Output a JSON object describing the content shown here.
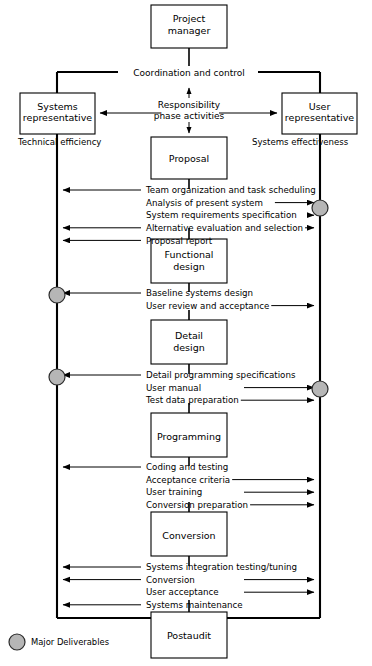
{
  "figure": {
    "colors": {
      "line": "#000000",
      "box_fill": "#ffffff",
      "deliverable_fill": "#b6b6b6",
      "deliverable_stroke": "#2b2b2b",
      "background": "#ffffff"
    }
  },
  "nodes": {
    "project_manager": {
      "line1": "Project",
      "line2": "manager"
    },
    "systems_representative": {
      "line1": "Systems",
      "line2": "representative"
    },
    "user_representative": {
      "line1": "User",
      "line2": "representative"
    },
    "phases": [
      {
        "id": "proposal",
        "line1": "Proposal",
        "line2": ""
      },
      {
        "id": "functional-design",
        "line1": "Functional",
        "line2": "design"
      },
      {
        "id": "detail-design",
        "line1": "Detail",
        "line2": "design"
      },
      {
        "id": "programming",
        "line1": "Programming",
        "line2": ""
      },
      {
        "id": "conversion",
        "line1": "Conversion",
        "line2": ""
      },
      {
        "id": "postaudit",
        "line1": "Postaudit",
        "line2": ""
      }
    ]
  },
  "labels": {
    "coordination": "Coordination and control",
    "responsibility_line1": "Responsibility",
    "responsibility_line2": "phase activities",
    "technical_efficiency": "Technical efficiency",
    "systems_effectiveness": "Systems effectiveness",
    "legend_major_deliverables": "Major Deliverables"
  },
  "activity_groups": [
    {
      "after": "proposal",
      "items": [
        {
          "text": "Team organization and task scheduling",
          "left": true,
          "right": false,
          "leader_left": true,
          "leader_right": false
        },
        {
          "text": "Analysis of present system",
          "left": false,
          "right": true,
          "leader_left": false,
          "leader_right": false
        },
        {
          "text": "System requirements specification",
          "left": false,
          "right": true,
          "leader_left": false,
          "leader_right": false
        },
        {
          "text": "Alternative evaluation and selection",
          "left": true,
          "right": true,
          "leader_left": true,
          "leader_right": true
        },
        {
          "text": "Proposal report",
          "left": true,
          "right": false,
          "leader_left": true,
          "leader_right": false
        }
      ]
    },
    {
      "after": "functional-design",
      "items": [
        {
          "text": "Baseline systems design",
          "left": true,
          "right": false,
          "leader_left": true,
          "leader_right": false
        },
        {
          "text": "User review and acceptance",
          "left": false,
          "right": true,
          "leader_left": false,
          "leader_right": true
        }
      ]
    },
    {
      "after": "detail-design",
      "items": [
        {
          "text": "Detail programming specifications",
          "left": true,
          "right": false,
          "leader_left": true,
          "leader_right": false
        },
        {
          "text": "User manual",
          "left": false,
          "right": true,
          "leader_left": false,
          "leader_right": false
        },
        {
          "text": "Test data preparation",
          "left": false,
          "right": true,
          "leader_left": false,
          "leader_right": true
        }
      ]
    },
    {
      "after": "programming",
      "items": [
        {
          "text": "Coding and testing",
          "left": true,
          "right": false,
          "leader_left": true,
          "leader_right": false
        },
        {
          "text": "Acceptance criteria",
          "left": false,
          "right": true,
          "leader_left": false,
          "leader_right": true
        },
        {
          "text": "User training",
          "left": false,
          "right": true,
          "leader_left": false,
          "leader_right": false
        },
        {
          "text": "Conversion preparation",
          "left": false,
          "right": true,
          "leader_left": false,
          "leader_right": true
        }
      ]
    },
    {
      "after": "conversion",
      "items": [
        {
          "text": "Systems integration testing/tuning",
          "left": true,
          "right": false,
          "leader_left": true,
          "leader_right": false
        },
        {
          "text": "Conversion",
          "left": true,
          "right": true,
          "leader_left": true,
          "leader_right": false
        },
        {
          "text": "User acceptance",
          "left": false,
          "right": true,
          "leader_left": false,
          "leader_right": false
        },
        {
          "text": "Systems maintenance",
          "left": true,
          "right": false,
          "leader_left": true,
          "leader_right": false
        }
      ]
    }
  ],
  "deliverable_markers": [
    {
      "side": "right",
      "y": 208
    },
    {
      "side": "left",
      "y": 295
    },
    {
      "side": "left",
      "y": 377
    },
    {
      "side": "right",
      "y": 389
    }
  ]
}
